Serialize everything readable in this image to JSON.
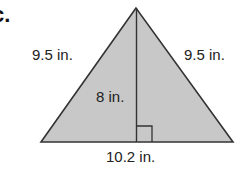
{
  "part_label": "c.",
  "figure": {
    "shape": "isosceles-triangle",
    "fill_color": "#c8c8c8",
    "stroke_color": "#333333",
    "labels": {
      "left_side": "9.5 in.",
      "right_side": "9.5 in.",
      "height": "8 in.",
      "base": "10.2 in."
    }
  }
}
